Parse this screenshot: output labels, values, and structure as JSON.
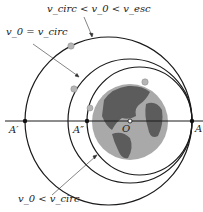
{
  "labels": {
    "top": "v_circ < v_0 < v_esc",
    "circ": "v_0 = v_circ",
    "bottom": "v_0 < v_circ",
    "A_prime": "A′",
    "A_double_prime": "A″",
    "O": "O",
    "A": "A"
  },
  "colors": {
    "orbit": "#1a1a1a",
    "earth_ocean": "#a8a8a8",
    "earth_land": "#5a5a5a",
    "satellite": "#b0b0b0"
  }
}
